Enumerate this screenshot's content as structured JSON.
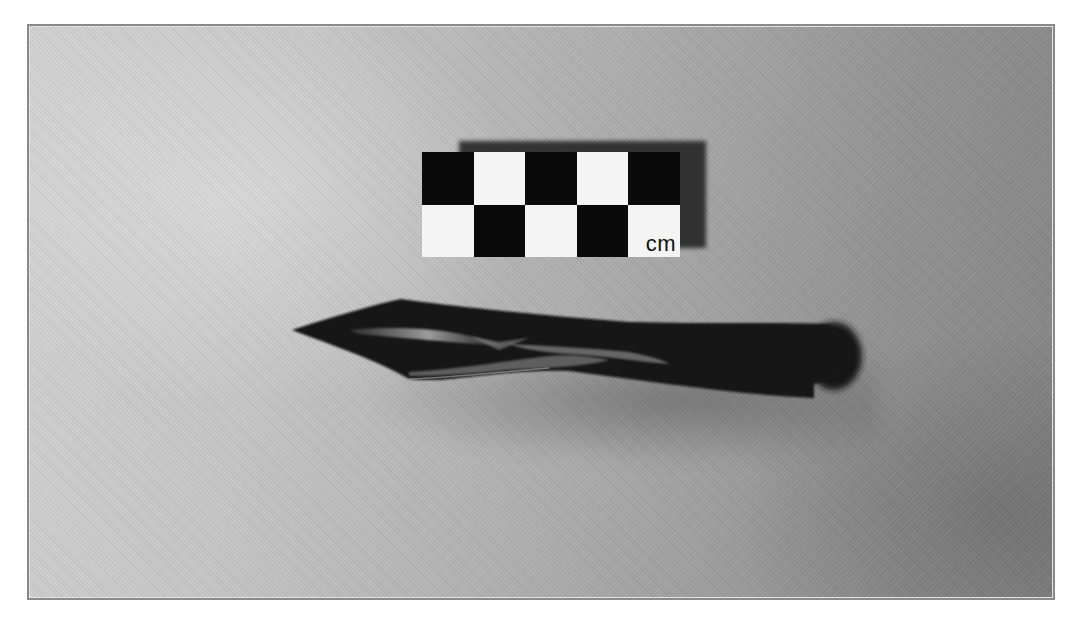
{
  "image": {
    "description": "Grayscale photograph of an elongated artifact (projectile point) on a gray surface with a checkered centimeter scale bar above it",
    "style": "grayscale",
    "background_colors": {
      "light": "#d2d2d2",
      "dark": "#858585"
    },
    "frame_color": "#8a8a8a"
  },
  "scale_bar": {
    "label": "cm",
    "columns": 5,
    "rows": 2,
    "pattern": [
      [
        "black",
        "white",
        "black",
        "white",
        "black"
      ],
      [
        "white",
        "black",
        "white",
        "black",
        "white"
      ]
    ],
    "colors": {
      "black": "#0a0a0a",
      "white": "#f4f4f4"
    }
  },
  "artifact": {
    "name": "projectile-point",
    "orientation": "horizontal, tip pointing left",
    "color": "#141414"
  }
}
